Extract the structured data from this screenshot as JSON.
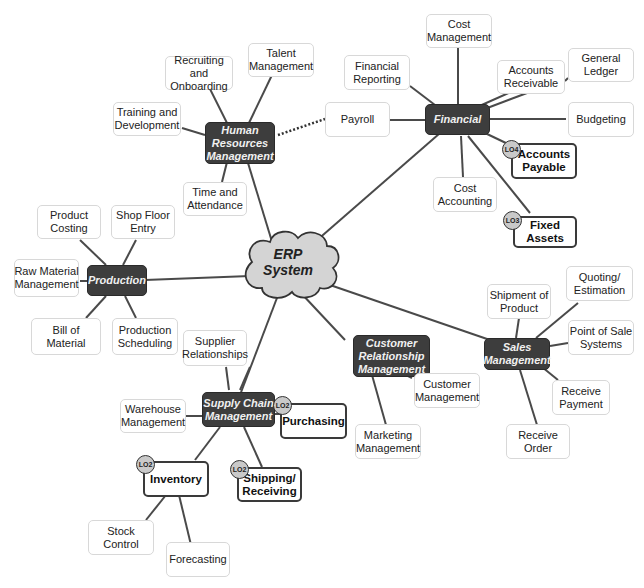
{
  "center": {
    "line1": "ERP",
    "line2": "System"
  },
  "hubs": {
    "hr": "Human Resources Management",
    "financial": "Financial",
    "production": "Production",
    "supply_chain": "Supply Chain Management",
    "crm": "Customer Relationship Management",
    "sales": "Sales Management"
  },
  "hr_items": {
    "recruiting": "Recruiting and Onboarding",
    "talent": "Talent Management",
    "training": "Training and Development",
    "time": "Time and Attendance"
  },
  "financial_items": {
    "payroll": "Payroll",
    "reporting": "Financial Reporting",
    "cost_mgmt": "Cost Management",
    "receivable": "Accounts Receivable",
    "ledger": "General Ledger",
    "budgeting": "Budgeting",
    "payable": "Accounts Payable",
    "cost_accounting": "Cost Accounting",
    "fixed_assets": "Fixed Assets"
  },
  "production_items": {
    "costing": "Product Costing",
    "shop_floor": "Shop Floor Entry",
    "raw_material": "Raw Material Management",
    "bom": "Bill of Material",
    "scheduling": "Production Scheduling"
  },
  "supply_items": {
    "supplier": "Supplier Relationships",
    "warehouse": "Warehouse Management",
    "purchasing": "Purchasing",
    "inventory": "Inventory",
    "shipping": "Shipping/ Receiving",
    "stock": "Stock Control",
    "forecasting": "Forecasting"
  },
  "crm_items": {
    "customer": "Customer Management",
    "marketing": "Marketing Management"
  },
  "sales_items": {
    "shipment": "Shipment of Product",
    "quoting": "Quoting/ Estimation",
    "pos": "Point of Sale Systems",
    "payment": "Receive Payment",
    "order": "Receive Order"
  },
  "badges": {
    "payable": "LO4",
    "fixed_assets": "LO3",
    "purchasing": "LO2",
    "inventory": "LO2",
    "shipping": "LO2"
  },
  "colors": {
    "hub_bg": "#3d3d3d",
    "cloud_fill": "#d4d4d4",
    "line": "#4a4a4a",
    "leaf_border": "#d8d8d8"
  }
}
